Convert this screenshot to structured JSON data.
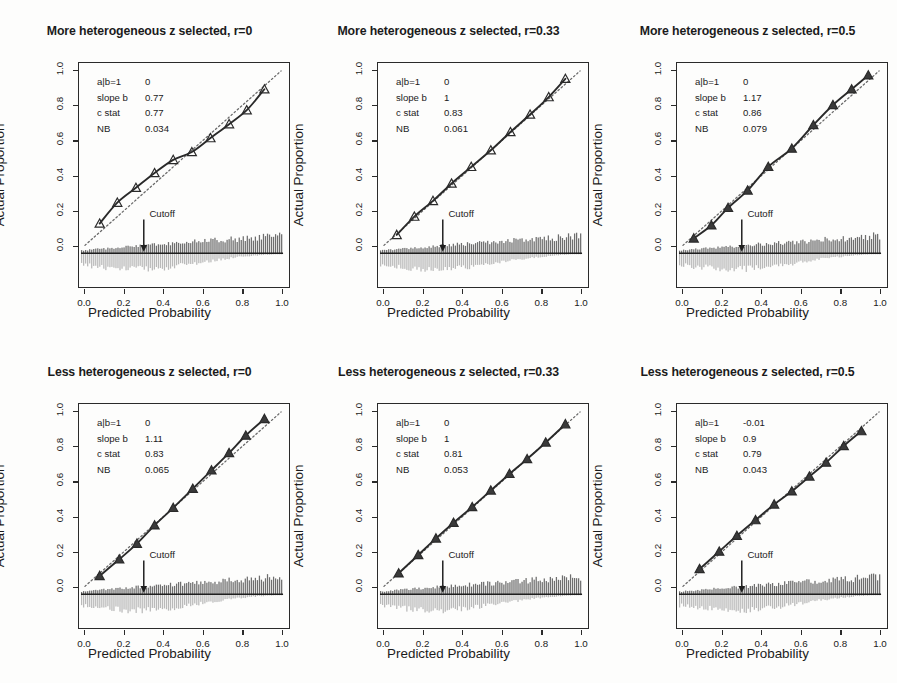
{
  "figure": {
    "background": "#fdfdfc",
    "ink": "#2a2a2a",
    "hist_up_color": "#6e6e6e",
    "hist_down_color": "#b9b9b9",
    "rows": 2,
    "cols": 3
  },
  "axis": {
    "xlabel": "Predicted Probability",
    "ylabel": "Actual Proportion",
    "xticks": [
      "0.0",
      "0.2",
      "0.4",
      "0.6",
      "0.8",
      "1.0"
    ],
    "yticks": [
      "0.0",
      "0.2",
      "0.4",
      "0.6",
      "0.8",
      "1.0"
    ],
    "xlim": [
      0,
      1
    ],
    "ylim": [
      0,
      1
    ],
    "cutoff_label": "Cutoff",
    "cutoff_x": 0.3
  },
  "annotation_keys": {
    "intercept": "a|b=1",
    "slope": "slope b",
    "cstat": "c stat",
    "nb": "NB"
  },
  "chart_data": [
    {
      "id": "panel-1",
      "type": "line",
      "title": "More heterogeneous z selected, r=0",
      "xlabel": "Predicted Probability",
      "ylabel": "Actual Proportion",
      "xlim": [
        0,
        1
      ],
      "ylim": [
        0,
        1
      ],
      "grid": false,
      "legend": "none",
      "stats": {
        "intercept": "0",
        "slope": "0.77",
        "cstat": "0.77",
        "nb": "0.034"
      },
      "reference_line": {
        "style": "dotted",
        "from": [
          0,
          0
        ],
        "to": [
          1,
          1
        ]
      },
      "series": [
        {
          "name": "calibration curve",
          "marker": "open-triangle",
          "x": [
            0.075,
            0.165,
            0.26,
            0.355,
            0.45,
            0.545,
            0.64,
            0.735,
            0.825,
            0.915
          ],
          "y": [
            0.125,
            0.245,
            0.33,
            0.415,
            0.49,
            0.535,
            0.615,
            0.695,
            0.775,
            0.895
          ]
        }
      ],
      "histogram": {
        "direction": "both",
        "n_bins": 100,
        "peak_side": "right"
      }
    },
    {
      "id": "panel-2",
      "type": "line",
      "title": "More heterogeneous z selected, r=0.33",
      "xlabel": "Predicted Probability",
      "ylabel": "Actual Proportion",
      "xlim": [
        0,
        1
      ],
      "ylim": [
        0,
        1
      ],
      "grid": false,
      "legend": "none",
      "stats": {
        "intercept": "0",
        "slope": "1",
        "cstat": "0.83",
        "nb": "0.061"
      },
      "reference_line": {
        "style": "dotted",
        "from": [
          0,
          0
        ],
        "to": [
          1,
          1
        ]
      },
      "series": [
        {
          "name": "calibration curve",
          "marker": "open-triangle",
          "x": [
            0.065,
            0.155,
            0.25,
            0.345,
            0.445,
            0.545,
            0.645,
            0.745,
            0.84,
            0.925
          ],
          "y": [
            0.06,
            0.165,
            0.255,
            0.355,
            0.45,
            0.545,
            0.65,
            0.75,
            0.85,
            0.955
          ]
        }
      ],
      "histogram": {
        "direction": "both",
        "n_bins": 100,
        "peak_side": "right"
      }
    },
    {
      "id": "panel-3",
      "type": "line",
      "title": "More heterogeneous z selected, r=0.5",
      "xlabel": "Predicted Probability",
      "ylabel": "Actual Proportion",
      "xlim": [
        0,
        1
      ],
      "ylim": [
        0,
        1
      ],
      "grid": false,
      "legend": "none",
      "stats": {
        "intercept": "0",
        "slope": "1.17",
        "cstat": "0.86",
        "nb": "0.079"
      },
      "reference_line": {
        "style": "dotted",
        "from": [
          0,
          0
        ],
        "to": [
          1,
          1
        ]
      },
      "series": [
        {
          "name": "calibration curve",
          "marker": "filled-triangle",
          "x": [
            0.055,
            0.145,
            0.23,
            0.33,
            0.435,
            0.555,
            0.665,
            0.765,
            0.86,
            0.945
          ],
          "y": [
            0.04,
            0.115,
            0.215,
            0.315,
            0.45,
            0.555,
            0.69,
            0.805,
            0.895,
            0.975
          ]
        }
      ],
      "histogram": {
        "direction": "both",
        "n_bins": 100,
        "peak_side": "right"
      }
    },
    {
      "id": "panel-4",
      "type": "line",
      "title": "Less heterogeneous z selected, r=0",
      "xlabel": "Predicted Probability",
      "ylabel": "Actual Proportion",
      "xlim": [
        0,
        1
      ],
      "ylim": [
        0,
        1
      ],
      "grid": false,
      "legend": "none",
      "stats": {
        "intercept": "0",
        "slope": "1.11",
        "cstat": "0.83",
        "nb": "0.065"
      },
      "reference_line": {
        "style": "dotted",
        "from": [
          0,
          0
        ],
        "to": [
          1,
          1
        ]
      },
      "series": [
        {
          "name": "calibration curve",
          "marker": "filled-triangle",
          "x": [
            0.075,
            0.175,
            0.265,
            0.355,
            0.45,
            0.55,
            0.645,
            0.735,
            0.82,
            0.915
          ],
          "y": [
            0.06,
            0.155,
            0.245,
            0.35,
            0.45,
            0.56,
            0.665,
            0.765,
            0.865,
            0.96
          ]
        }
      ],
      "histogram": {
        "direction": "both",
        "n_bins": 100,
        "peak_side": "right"
      }
    },
    {
      "id": "panel-5",
      "type": "line",
      "title": "Less heterogeneous z selected, r=0.33",
      "xlabel": "Predicted Probability",
      "ylabel": "Actual Proportion",
      "xlim": [
        0,
        1
      ],
      "ylim": [
        0,
        1
      ],
      "grid": false,
      "legend": "none",
      "stats": {
        "intercept": "0",
        "slope": "1",
        "cstat": "0.81",
        "nb": "0.053"
      },
      "reference_line": {
        "style": "dotted",
        "from": [
          0,
          0
        ],
        "to": [
          1,
          1
        ]
      },
      "series": [
        {
          "name": "calibration curve",
          "marker": "filled-triangle",
          "x": [
            0.075,
            0.175,
            0.265,
            0.355,
            0.45,
            0.545,
            0.64,
            0.73,
            0.825,
            0.925
          ],
          "y": [
            0.075,
            0.18,
            0.275,
            0.365,
            0.455,
            0.55,
            0.645,
            0.73,
            0.825,
            0.93
          ]
        }
      ],
      "histogram": {
        "direction": "both",
        "n_bins": 100,
        "peak_side": "right"
      }
    },
    {
      "id": "panel-6",
      "type": "line",
      "title": "Less heterogeneous z selected, r=0.5",
      "xlabel": "Predicted Probability",
      "ylabel": "Actual Proportion",
      "xlim": [
        0,
        1
      ],
      "ylim": [
        0,
        1
      ],
      "grid": false,
      "legend": "none",
      "stats": {
        "intercept": "-0.01",
        "slope": "0.9",
        "cstat": "0.79",
        "nb": "0.043"
      },
      "reference_line": {
        "style": "dotted",
        "from": [
          0,
          0
        ],
        "to": [
          1,
          1
        ]
      },
      "series": [
        {
          "name": "calibration curve",
          "marker": "filled-triangle",
          "x": [
            0.085,
            0.185,
            0.275,
            0.37,
            0.465,
            0.555,
            0.645,
            0.73,
            0.82,
            0.91
          ],
          "y": [
            0.1,
            0.2,
            0.29,
            0.38,
            0.47,
            0.545,
            0.63,
            0.71,
            0.805,
            0.89
          ]
        }
      ],
      "histogram": {
        "direction": "both",
        "n_bins": 100,
        "peak_side": "right"
      }
    }
  ]
}
